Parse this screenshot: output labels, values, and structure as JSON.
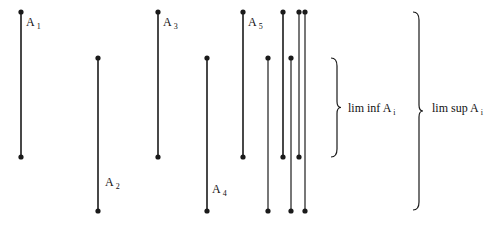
{
  "diagram": {
    "title": "",
    "colors": {
      "line": "#1a1a1a",
      "gray_line": "#555555",
      "background": "#ffffff"
    },
    "sets": [
      {
        "label": "A",
        "sub": "1",
        "x": 21,
        "y1": 12,
        "y2": 157,
        "label_x": 27,
        "label_y": 23
      },
      {
        "label": "A",
        "sub": "2",
        "x": 98,
        "y1": 58,
        "y2": 211,
        "label_x": 106,
        "label_y": 175
      },
      {
        "label": "A",
        "sub": "3",
        "x": 158,
        "y1": 12,
        "y2": 157,
        "label_x": 163,
        "label_y": 23
      },
      {
        "label": "A",
        "sub": "4",
        "x": 207,
        "y1": 58,
        "y2": 211,
        "label_x": 213,
        "label_y": 183
      },
      {
        "label": "A",
        "sub": "5",
        "x": 243,
        "y1": 12,
        "y2": 157,
        "label_x": 248,
        "label_y": 23
      },
      {
        "label": "",
        "sub": "",
        "x": 268,
        "y1": 58,
        "y2": 211
      },
      {
        "label": "",
        "sub": "",
        "x": 283,
        "y1": 12,
        "y2": 157
      },
      {
        "label": "",
        "sub": "",
        "x": 291,
        "y1": 58,
        "y2": 211
      },
      {
        "label": "",
        "sub": "",
        "x": 299,
        "y1": 12,
        "y2": 157
      },
      {
        "label": "",
        "sub": "",
        "x": 305,
        "y1": 12,
        "y2": 211
      }
    ],
    "braces": [
      {
        "name": "lim-inf",
        "x": 331,
        "y1": 58,
        "y2": 157,
        "label": "lim inf A",
        "sub": "i",
        "label_x": 348,
        "label_y": 103
      },
      {
        "name": "lim-sup",
        "x": 413,
        "y1": 12,
        "y2": 210,
        "label": "lim sup A",
        "sub": "i",
        "label_x": 432,
        "label_y": 103
      }
    ]
  },
  "labels": {
    "a1": "A",
    "a1_sub": "1",
    "a2": "A",
    "a2_sub": "2",
    "a3": "A",
    "a3_sub": "3",
    "a4": "A",
    "a4_sub": "4",
    "a5": "A",
    "a5_sub": "5",
    "liminf": "lim inf A",
    "liminf_sub": "i",
    "limsup": "lim sup A",
    "limsup_sub": "i"
  }
}
